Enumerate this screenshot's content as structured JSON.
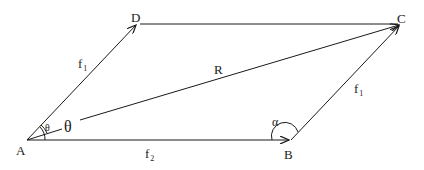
{
  "diagram": {
    "points": {
      "A": {
        "label": "A",
        "x": 27,
        "y": 140
      },
      "B": {
        "label": "B",
        "x": 291,
        "y": 140
      },
      "C": {
        "label": "C",
        "x": 401,
        "y": 24
      },
      "D": {
        "label": "D",
        "x": 137,
        "y": 24
      }
    },
    "vectors": [
      {
        "name": "f1",
        "from": "A",
        "to": "D",
        "label": "f",
        "subscript": "1"
      },
      {
        "name": "f2",
        "from": "A",
        "to": "B",
        "label": "f",
        "subscript": "2"
      },
      {
        "name": "R",
        "from": "A",
        "to": "C",
        "label": "R"
      },
      {
        "name": "f1-parallel",
        "from": "B",
        "to": "C",
        "label": "f",
        "subscript": "1"
      },
      {
        "name": "DC",
        "from": "D",
        "to": "C",
        "label": ""
      }
    ],
    "angles": {
      "theta_small": "θ",
      "theta_large": "θ",
      "alpha": "α"
    },
    "colors": {
      "line": "#1a1a1a",
      "background": "#ffffff"
    }
  }
}
